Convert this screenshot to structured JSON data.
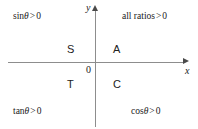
{
  "diagram": {
    "type": "cast-quadrant-diagram",
    "axes": {
      "x_label": "x",
      "y_label": "y",
      "origin_label": "0",
      "x_arrow_icon": "arrow-right-icon",
      "y_arrow_icon": "arrow-up-icon"
    },
    "quadrant_letters": {
      "second": "S",
      "first": "A",
      "third": "T",
      "fourth": "C"
    },
    "annotations": {
      "top_left": {
        "function": "sin",
        "variable": "θ",
        "operator": ">",
        "value": "0"
      },
      "top_right": {
        "function": "all ratios",
        "variable": "",
        "operator": ">",
        "value": "0"
      },
      "bottom_left": {
        "function": "tan",
        "variable": "θ",
        "operator": ">",
        "value": "0"
      },
      "bottom_right": {
        "function": "cos",
        "variable": "θ",
        "operator": ">",
        "value": "0"
      }
    },
    "colors": {
      "background": "#ffffff",
      "axis_line": "#8d8d8d",
      "arrow_head": "#4a4a4a",
      "text": "#1a1a1a",
      "quadrant_letter": "#222222"
    }
  }
}
